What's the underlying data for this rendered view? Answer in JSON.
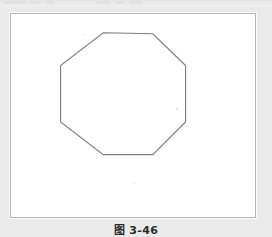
{
  "page": {
    "background_color": "#ebeaea",
    "top_bleed_present": true
  },
  "figure": {
    "caption": "图 3-46",
    "frame": {
      "border_color": "#b6b5b5",
      "fill_color": "#fefefe",
      "x": 10,
      "y": 13,
      "width": 246,
      "height": 205
    },
    "shape": {
      "name": "regular-octagon",
      "sides": 8,
      "stroke_color": "#7d7d7d",
      "stroke_width": 1,
      "fill": "none",
      "orientation": "flat-top",
      "center_x": 123,
      "center_y": 100,
      "bounds": {
        "left": 60,
        "top": 32,
        "right": 186,
        "bottom": 155
      },
      "points": [
        {
          "x": 103,
          "y": 32
        },
        {
          "x": 153,
          "y": 33
        },
        {
          "x": 186,
          "y": 65
        },
        {
          "x": 186,
          "y": 122
        },
        {
          "x": 153,
          "y": 155
        },
        {
          "x": 103,
          "y": 155
        },
        {
          "x": 60,
          "y": 122
        },
        {
          "x": 60,
          "y": 65
        }
      ]
    },
    "artifacts": [
      {
        "name": "scan-speck-right",
        "x": 165,
        "y": 94
      },
      {
        "name": "scan-speck-bottom",
        "x": 122,
        "y": 168
      },
      {
        "name": "scan-speck-topleft",
        "x": 73,
        "y": 20
      }
    ]
  }
}
